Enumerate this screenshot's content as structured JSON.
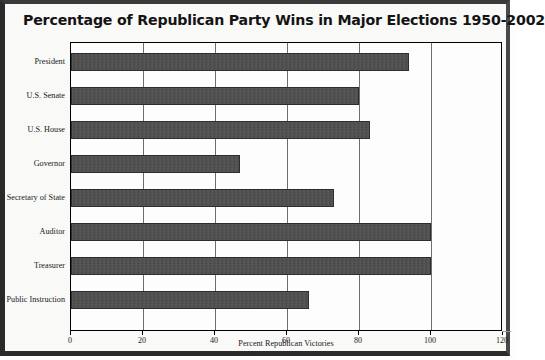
{
  "chart_title": "Percentage of Republican Party Wins in Major Elections 1950-2002",
  "axis": {
    "x_title": "Percent Republican Victories",
    "tick_labels": [
      "0",
      "20",
      "40",
      "60",
      "80",
      "100",
      "120"
    ]
  },
  "chart_data": {
    "type": "bar",
    "orientation": "horizontal",
    "title": "Percentage of Republican Party Wins in Major Elections 1950-2002",
    "xlabel": "Percent Republican Victories",
    "ylabel": "",
    "categories": [
      "President",
      "U.S. Senate",
      "U.S. House",
      "Governor",
      "Secretary of State",
      "Auditor",
      "Treasurer",
      "Public Instruction"
    ],
    "values": [
      94,
      80,
      83,
      47,
      73,
      100,
      100,
      66
    ],
    "xlim": [
      0,
      120
    ],
    "xticks": [
      0,
      20,
      40,
      60,
      80,
      100,
      120
    ],
    "grid": true,
    "grid_axis": "x",
    "legend": false,
    "bar_color": "#4c4c4c"
  }
}
